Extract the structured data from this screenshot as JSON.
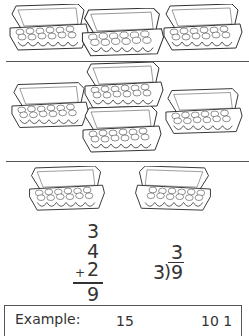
{
  "worksheet": {
    "illustration_rows": [
      {
        "name": "three-cartons-row",
        "carton_count": 3
      },
      {
        "name": "four-cartons-row",
        "carton_count": 4
      },
      {
        "name": "two-cartons-row",
        "carton_count": 2
      }
    ],
    "addition_problem": {
      "addend_1": "3",
      "addend_2": "4",
      "addend_3": "2",
      "operator": "+",
      "sum": "9"
    },
    "division_problem": {
      "divisor": "3",
      "dividend": "9",
      "quotient": "3",
      "bracket": ")"
    },
    "example_box": {
      "label": "Example:",
      "value_1": "15",
      "value_2": "10 1"
    },
    "colors": {
      "ink": "#333333",
      "background": "#ffffff"
    }
  }
}
